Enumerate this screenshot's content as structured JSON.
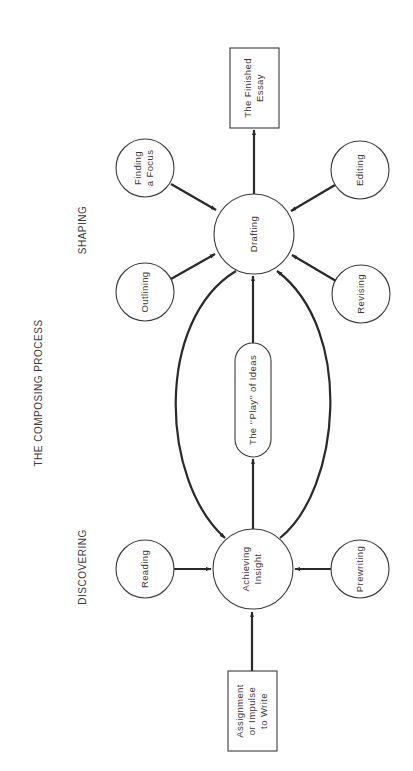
{
  "title": "THE COMPOSING PROCESS",
  "sections": {
    "shaping": "SHAPING",
    "discovering": "DISCOVERING"
  },
  "nodes": {
    "finished_essay": {
      "lines": [
        "The Finished",
        "Essay"
      ],
      "shape": "rectangle"
    },
    "finding_focus": {
      "lines": [
        "Finding",
        "a Focus"
      ],
      "shape": "circle"
    },
    "editing": {
      "lines": [
        "Editing"
      ],
      "shape": "circle"
    },
    "drafting": {
      "lines": [
        "Drafting"
      ],
      "shape": "circle"
    },
    "outlining": {
      "lines": [
        "Outlining"
      ],
      "shape": "circle"
    },
    "revising": {
      "lines": [
        "Revising"
      ],
      "shape": "circle"
    },
    "play_of_ideas": {
      "lines": [
        "The ‘‘Play’’ of Ideas"
      ],
      "shape": "pill"
    },
    "achieving_insight": {
      "lines": [
        "Achieving",
        "Insight"
      ],
      "shape": "circle"
    },
    "reading": {
      "lines": [
        "Reading"
      ],
      "shape": "circle"
    },
    "prewriting": {
      "lines": [
        "Prewriting"
      ],
      "shape": "circle"
    },
    "assignment": {
      "lines": [
        "Assignment",
        "or Impulse",
        "to Write"
      ],
      "shape": "rectangle"
    }
  },
  "edges": [
    {
      "from": "assignment",
      "to": "achieving_insight"
    },
    {
      "from": "reading",
      "to": "achieving_insight"
    },
    {
      "from": "prewriting",
      "to": "achieving_insight"
    },
    {
      "from": "achieving_insight",
      "to": "play_of_ideas"
    },
    {
      "from": "play_of_ideas",
      "to": "drafting"
    },
    {
      "from": "achieving_insight",
      "to": "drafting",
      "curve": "right"
    },
    {
      "from": "drafting",
      "to": "achieving_insight",
      "curve": "left"
    },
    {
      "from": "outlining",
      "to": "drafting"
    },
    {
      "from": "finding_focus",
      "to": "drafting"
    },
    {
      "from": "revising",
      "to": "drafting"
    },
    {
      "from": "editing",
      "to": "drafting"
    },
    {
      "from": "drafting",
      "to": "finished_essay"
    }
  ],
  "colors": {
    "ink": "#2a2a2a",
    "text": "#3a3a3a",
    "background": "#ffffff"
  }
}
